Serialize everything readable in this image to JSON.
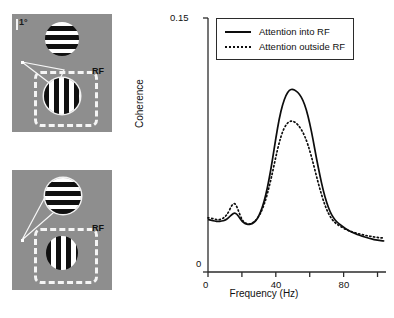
{
  "figure": {
    "panels": [
      {
        "id": "attention-into-rf",
        "scale_label": "1°",
        "rf_label": "RF",
        "attended_stimulus": "lower-vertical-grating",
        "gratings": [
          {
            "orientation": "horizontal",
            "position": "upper",
            "inside_rf": false
          },
          {
            "orientation": "vertical",
            "position": "lower",
            "inside_rf": true
          }
        ]
      },
      {
        "id": "attention-outside-rf",
        "scale_label": "",
        "rf_label": "RF",
        "attended_stimulus": "upper-horizontal-grating",
        "gratings": [
          {
            "orientation": "horizontal",
            "position": "upper",
            "inside_rf": false
          },
          {
            "orientation": "vertical",
            "position": "lower",
            "inside_rf": true
          }
        ]
      }
    ],
    "caption_strip": ""
  },
  "chart_data": {
    "type": "line",
    "title": "",
    "xlabel": "Frequency (Hz)",
    "ylabel": "Coherence",
    "xlim": [
      0,
      105
    ],
    "ylim": [
      0,
      0.15
    ],
    "xticks": [
      0,
      20,
      40,
      60,
      80,
      100
    ],
    "xtick_labels": [
      "0",
      "",
      "40",
      "",
      "80",
      ""
    ],
    "yticks": [
      0,
      0.15
    ],
    "ytick_labels": [
      "0",
      "0.15"
    ],
    "grid": false,
    "legend_position": "top-right",
    "series": [
      {
        "name": "Attention into RF",
        "style": "solid",
        "color": "#0d0d0d",
        "x": [
          0,
          2,
          4,
          6,
          8,
          10,
          12,
          14,
          16,
          18,
          20,
          22,
          24,
          26,
          28,
          30,
          32,
          34,
          36,
          38,
          40,
          42,
          44,
          46,
          48,
          50,
          52,
          54,
          56,
          58,
          60,
          62,
          64,
          66,
          68,
          70,
          72,
          74,
          76,
          78,
          80,
          82,
          84,
          86,
          88,
          90,
          92,
          94,
          96,
          98,
          100,
          102,
          104
        ],
        "y": [
          0.031,
          0.0305,
          0.03,
          0.0298,
          0.03,
          0.0305,
          0.0318,
          0.034,
          0.0352,
          0.033,
          0.03,
          0.0285,
          0.028,
          0.0285,
          0.03,
          0.033,
          0.038,
          0.045,
          0.0545,
          0.066,
          0.079,
          0.0905,
          0.099,
          0.1045,
          0.1075,
          0.108,
          0.107,
          0.105,
          0.1015,
          0.096,
          0.088,
          0.078,
          0.067,
          0.057,
          0.048,
          0.041,
          0.0355,
          0.032,
          0.0295,
          0.028,
          0.0265,
          0.025,
          0.024,
          0.023,
          0.0222,
          0.0215,
          0.0208,
          0.0202,
          0.0197,
          0.0192,
          0.0188,
          0.0185,
          0.0183
        ]
      },
      {
        "name": "Attention outside RF",
        "style": "dotted",
        "color": "#0d0d0d",
        "x": [
          0,
          2,
          4,
          6,
          8,
          10,
          12,
          14,
          16,
          18,
          20,
          22,
          24,
          26,
          28,
          30,
          32,
          34,
          36,
          38,
          40,
          42,
          44,
          46,
          48,
          50,
          52,
          54,
          56,
          58,
          60,
          62,
          64,
          66,
          68,
          70,
          72,
          74,
          76,
          78,
          80,
          82,
          84,
          86,
          88,
          90,
          92,
          94,
          96,
          98,
          100,
          102,
          104
        ],
        "y": [
          0.032,
          0.0318,
          0.0312,
          0.0308,
          0.0312,
          0.0325,
          0.035,
          0.0395,
          0.041,
          0.036,
          0.0308,
          0.0288,
          0.0282,
          0.0288,
          0.0302,
          0.0328,
          0.0368,
          0.0425,
          0.05,
          0.0585,
          0.068,
          0.0765,
          0.083,
          0.087,
          0.089,
          0.0892,
          0.088,
          0.0858,
          0.0825,
          0.078,
          0.0718,
          0.0645,
          0.0565,
          0.049,
          0.0422,
          0.0368,
          0.0328,
          0.03,
          0.0282,
          0.027,
          0.0258,
          0.0248,
          0.024,
          0.0234,
          0.0228,
          0.0223,
          0.0218,
          0.0214,
          0.021,
          0.0207,
          0.0204,
          0.0202,
          0.02
        ]
      }
    ]
  },
  "legend": {
    "items": [
      {
        "label": "Attention into RF",
        "style": "solid"
      },
      {
        "label": "Attention outside RF",
        "style": "dotted"
      }
    ]
  }
}
